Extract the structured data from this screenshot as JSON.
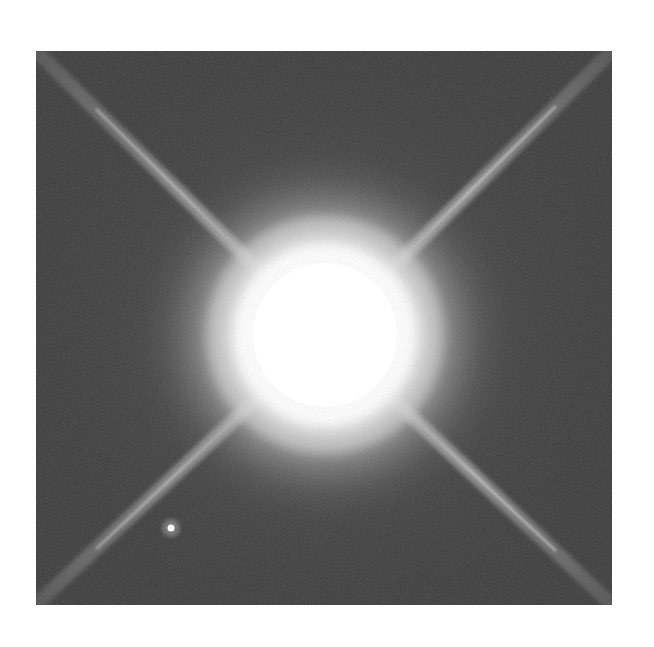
{
  "image": {
    "subject": "Bright star with four diffraction spikes and faint companion",
    "colors": {
      "background": "#3b3b3b",
      "halo": "#bdbdbd",
      "core": "#ffffff",
      "spike": "#d8d8d8",
      "page": "#ffffff"
    },
    "frame": {
      "x": 36,
      "y": 51,
      "width": 576,
      "height": 554
    },
    "primary_star": {
      "cx": 289,
      "cy": 284,
      "core_radius": 85,
      "halo_radius": 130
    },
    "companion_star": {
      "cx": 135,
      "cy": 477,
      "radius": 4
    },
    "spikes": [
      {
        "name": "upper-left",
        "x1": 0,
        "y1": 0,
        "x2": 289,
        "y2": 284
      },
      {
        "name": "upper-right",
        "x1": 576,
        "y1": 0,
        "x2": 289,
        "y2": 284
      },
      {
        "name": "lower-left",
        "x1": 0,
        "y1": 554,
        "x2": 289,
        "y2": 284
      },
      {
        "name": "lower-right",
        "x1": 576,
        "y1": 554,
        "x2": 289,
        "y2": 284
      }
    ]
  }
}
